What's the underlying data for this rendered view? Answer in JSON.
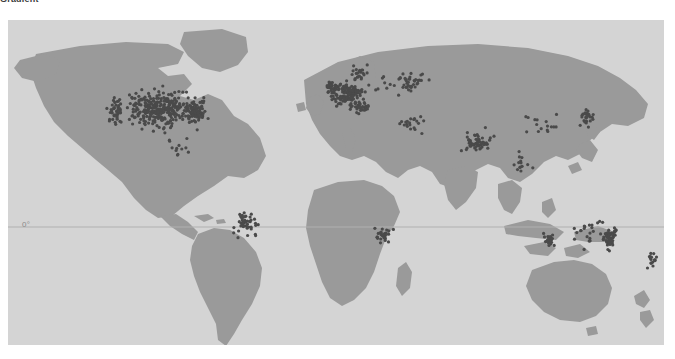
{
  "caption": {
    "text": "Gradient"
  },
  "figure": {
    "name": "world-point-distribution-map",
    "ocean_color": "#d4d4d4",
    "land_color": "#9a9a9a",
    "point_color": "#4a4a4a",
    "graticule_color": "#a8a8a8"
  },
  "axes": {
    "equator": {
      "label": "0°",
      "latitude": 0,
      "visible": true
    }
  },
  "chart_data": {
    "type": "scatter",
    "title": "",
    "subtitle": "",
    "xlabel": "Longitude",
    "ylabel": "Latitude",
    "xlim": [
      -180,
      180
    ],
    "ylim": [
      -90,
      90
    ],
    "grid": false,
    "legend": null,
    "projection": "equirectangular",
    "annotations": [
      {
        "text": "0°",
        "x": -178,
        "y": 0
      }
    ],
    "series": [
      {
        "name": "observation-sites",
        "marker": "circle",
        "color": "#4a4a4a",
        "size": 1.6,
        "clusters": [
          {
            "region": "North America (USA / Canada)",
            "cx": -96,
            "cy": 41,
            "sx": 17,
            "sy": 8,
            "count": 300
          },
          {
            "region": "US East Coast",
            "cx": -77,
            "cy": 39,
            "sx": 5,
            "sy": 4,
            "count": 70
          },
          {
            "region": "US West Coast",
            "cx": -121,
            "cy": 39,
            "sx": 3,
            "sy": 6,
            "count": 40
          },
          {
            "region": "Western Europe",
            "cx": 6,
            "cy": 49,
            "sx": 7,
            "sy": 5,
            "count": 130
          },
          {
            "region": "United Kingdom",
            "cx": -2,
            "cy": 53,
            "sx": 2.5,
            "sy": 2.5,
            "count": 28
          },
          {
            "region": "Scandinavia",
            "cx": 14,
            "cy": 60,
            "sx": 5,
            "sy": 3.5,
            "count": 22
          },
          {
            "region": "Eastern Europe / Russia",
            "cx": 38,
            "cy": 55,
            "sx": 11,
            "sy": 5,
            "count": 45
          },
          {
            "region": "Mediterranean / Italy",
            "cx": 13,
            "cy": 42,
            "sx": 5,
            "sy": 3,
            "count": 35
          },
          {
            "region": "Middle East",
            "cx": 42,
            "cy": 33,
            "sx": 7,
            "sy": 4,
            "count": 20
          },
          {
            "region": "Indian subcontinent",
            "cx": 78,
            "cy": 22,
            "sx": 6,
            "sy": 5,
            "count": 60
          },
          {
            "region": "Southeast Asia",
            "cx": 103,
            "cy": 10,
            "sx": 4,
            "sy": 5,
            "count": 14
          },
          {
            "region": "China / Korea",
            "cx": 112,
            "cy": 33,
            "sx": 8,
            "sy": 5,
            "count": 16
          },
          {
            "region": "Japan",
            "cx": 138,
            "cy": 36,
            "sx": 3,
            "sy": 4,
            "count": 30
          },
          {
            "region": "Eastern Australia",
            "cx": 150,
            "cy": -31,
            "sx": 3.5,
            "sy": 6,
            "count": 55
          },
          {
            "region": "Southwest Australia",
            "cx": 117,
            "cy": -32,
            "sx": 2.5,
            "sy": 3,
            "count": 25
          },
          {
            "region": "Central Australia",
            "cx": 138,
            "cy": -26,
            "sx": 7,
            "sy": 6,
            "count": 20
          },
          {
            "region": "New Zealand",
            "cx": 173,
            "cy": -42,
            "sx": 2.5,
            "sy": 3.5,
            "count": 16
          },
          {
            "region": "Southeast Brazil / Argentina",
            "cx": -50,
            "cy": -23,
            "sx": 5,
            "sy": 6,
            "count": 45
          },
          {
            "region": "South Africa",
            "cx": 26,
            "cy": -29,
            "sx": 4,
            "sy": 3,
            "count": 28
          },
          {
            "region": "Central America / Caribbean",
            "cx": -86,
            "cy": 19,
            "sx": 6,
            "sy": 4,
            "count": 12
          }
        ],
        "total_points": 1011
      }
    ]
  }
}
